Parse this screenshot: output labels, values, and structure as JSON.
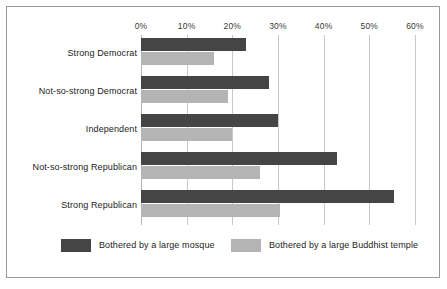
{
  "chart_data": {
    "type": "bar",
    "orientation": "horizontal",
    "title": "",
    "subtitle": "",
    "xlabel": "",
    "ylabel": "",
    "xlim": [
      0,
      60
    ],
    "xticks": [
      0,
      10,
      20,
      30,
      40,
      50,
      60
    ],
    "xtick_labels": [
      "0%",
      "10%",
      "20%",
      "30%",
      "40%",
      "50%",
      "60%"
    ],
    "grid": true,
    "legend_position": "bottom",
    "categories": [
      "Strong Democrat",
      "Not-so-strong Democrat",
      "Independent",
      "Not-so-strong Republican",
      "Strong Republican"
    ],
    "series": [
      {
        "name": "Bothered by a large mosque",
        "color": "#454545",
        "values": [
          23,
          28,
          30,
          43,
          55.5
        ]
      },
      {
        "name": "Bothered by a large Buddhist temple",
        "color": "#b4b4b4",
        "values": [
          16,
          19,
          20,
          26,
          30.5
        ]
      }
    ]
  },
  "colors": {
    "series1": "#454545",
    "series2": "#b4b4b4",
    "gridline": "#c8c8c8",
    "frame": "#9a9a9a",
    "text": "#1c1c1c",
    "background": "#ffffff"
  }
}
